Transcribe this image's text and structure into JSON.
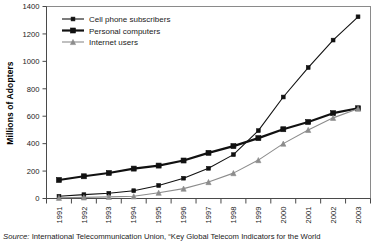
{
  "chart_data": {
    "type": "line",
    "title": "",
    "xlabel": "",
    "ylabel": "Millions of Adopters",
    "categories": [
      "1991",
      "1992",
      "1993",
      "1994",
      "1995",
      "1996",
      "1997",
      "1998",
      "1999",
      "2000",
      "2001",
      "2002",
      "2003"
    ],
    "ylim": [
      0,
      1400
    ],
    "ytick_values": [
      0,
      200,
      400,
      600,
      800,
      1000,
      1200,
      1400
    ],
    "ytick_labels": [
      "0",
      "200",
      "400",
      "600",
      "800",
      "1000",
      "1200",
      "1400"
    ],
    "grid": false,
    "legend_position": "top-left inside plot",
    "series": [
      {
        "name": "Cell phone subscribers",
        "marker": "square-small",
        "color": "#111111",
        "line_width": 1.1,
        "values": [
          16,
          28,
          38,
          57,
          95,
          148,
          220,
          320,
          495,
          740,
          955,
          1155,
          1325
        ]
      },
      {
        "name": "Personal computers",
        "marker": "square-large",
        "color": "#111111",
        "line_width": 2.2,
        "values": [
          135,
          162,
          186,
          218,
          240,
          277,
          333,
          382,
          440,
          505,
          558,
          622,
          658
        ]
      },
      {
        "name": "Internet users",
        "marker": "triangle",
        "color": "#8c8c8c",
        "line_width": 1.1,
        "values": [
          5,
          8,
          12,
          16,
          42,
          72,
          120,
          185,
          280,
          400,
          500,
          588,
          655
        ]
      }
    ]
  },
  "source": {
    "label": "Source:",
    "text": " International Telecommunication Union, “Key Global Telecom Indicators for the World"
  }
}
